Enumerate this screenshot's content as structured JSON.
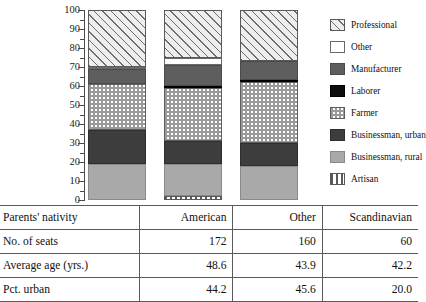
{
  "chart_data": {
    "type": "bar",
    "subtype": "stacked-100-percent",
    "title": "",
    "xlabel": "",
    "ylabel": "",
    "ylim": [
      0,
      100
    ],
    "ytick_step": 10,
    "grid": false,
    "legend_position": "right",
    "categories": [
      "American",
      "Other",
      "Scandinavian"
    ],
    "yticks": [
      "100",
      "90",
      "80",
      "70",
      "60",
      "50",
      "40",
      "30",
      "20",
      "10",
      "0"
    ],
    "series": [
      {
        "name": "Artisan",
        "key": "artisan",
        "pattern": "vertical-stripes",
        "values": [
          0,
          2,
          0
        ]
      },
      {
        "name": "Businessman, rural",
        "key": "bus-rural",
        "pattern": "solid-light-gray",
        "values": [
          19,
          17,
          18
        ]
      },
      {
        "name": "Businessman, urban",
        "key": "bus-urban",
        "pattern": "solid-dark-gray",
        "values": [
          18,
          12,
          12
        ]
      },
      {
        "name": "Farmer",
        "key": "farmer",
        "pattern": "checkerboard",
        "values": [
          24,
          28,
          32
        ]
      },
      {
        "name": "Laborer",
        "key": "laborer",
        "pattern": "solid-black",
        "values": [
          0,
          1,
          1
        ]
      },
      {
        "name": "Manufacturer",
        "key": "manufacturer",
        "pattern": "solid-mid-gray",
        "values": [
          8,
          11,
          10
        ]
      },
      {
        "name": "Other",
        "key": "other",
        "pattern": "white",
        "values": [
          1,
          4,
          0
        ]
      },
      {
        "name": "Professional",
        "key": "professional",
        "pattern": "diagonal-hatch",
        "values": [
          30,
          25,
          27
        ]
      }
    ]
  },
  "legend": {
    "items": [
      {
        "label": "Professional",
        "key": "professional"
      },
      {
        "label": "Other",
        "key": "other"
      },
      {
        "label": "Manufacturer",
        "key": "manufacturer"
      },
      {
        "label": "Laborer",
        "key": "laborer"
      },
      {
        "label": "Farmer",
        "key": "farmer"
      },
      {
        "label": "Businessman, urban",
        "key": "bus-urban"
      },
      {
        "label": "Businessman, rural",
        "key": "bus-rural"
      },
      {
        "label": "Artisan",
        "key": "artisan"
      }
    ]
  },
  "table": {
    "rows": [
      {
        "label": "Parents' nativity",
        "american": "American",
        "other": "Other",
        "scandinavian": "Scandinavian"
      },
      {
        "label": "No. of seats",
        "american": "172",
        "other": "160",
        "scandinavian": "60"
      },
      {
        "label": "Average age (yrs.)",
        "american": "48.6",
        "other": "43.9",
        "scandinavian": "42.2"
      },
      {
        "label": "Pct. urban",
        "american": "44.2",
        "other": "45.6",
        "scandinavian": "20.0"
      }
    ]
  }
}
